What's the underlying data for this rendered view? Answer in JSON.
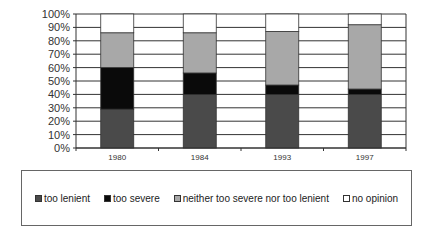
{
  "chart_data": {
    "type": "bar",
    "stacked": true,
    "percent": true,
    "title": "",
    "xlabel": "",
    "ylabel": "",
    "categories": [
      "1980",
      "1984",
      "1993",
      "1997"
    ],
    "series": [
      {
        "name": "too lenient",
        "color": "#4a4a4a",
        "values": [
          29,
          40,
          40,
          40
        ]
      },
      {
        "name": "too severe",
        "color": "#0a0a0a",
        "values": [
          31,
          16,
          7,
          4
        ]
      },
      {
        "name": "neither too severe nor too lenient",
        "color": "#a8a8a8",
        "values": [
          26,
          30,
          40,
          48
        ]
      },
      {
        "name": "no opinion",
        "color": "#ffffff",
        "values": [
          14,
          14,
          13,
          8
        ]
      }
    ],
    "ylim": [
      0,
      100
    ],
    "yticks": [
      "0%",
      "10%",
      "20%",
      "30%",
      "40%",
      "50%",
      "60%",
      "70%",
      "80%",
      "90%",
      "100%"
    ],
    "grid": true,
    "legend_position": "bottom"
  },
  "legend": {
    "items": [
      {
        "label": "too lenient",
        "color": "#4a4a4a"
      },
      {
        "label": "too severe",
        "color": "#0a0a0a"
      },
      {
        "label": "neither too severe nor too lenient",
        "color": "#a8a8a8"
      },
      {
        "label": "no opinion",
        "color": "#ffffff"
      }
    ]
  }
}
